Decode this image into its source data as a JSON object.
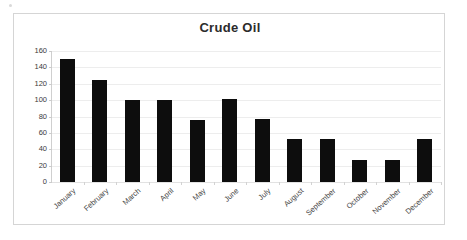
{
  "chart_data": {
    "type": "bar",
    "title": "Crude Oil",
    "xlabel": "",
    "ylabel": "",
    "ylim": [
      0,
      160
    ],
    "ytick_step": 20,
    "yticks": [
      160,
      140,
      120,
      100,
      80,
      60,
      40,
      20,
      0
    ],
    "grid": true,
    "legend": "none",
    "bar_color": "#0d0d0d",
    "gridline_color": "#ededed",
    "categories": [
      "January",
      "February",
      "March",
      "April",
      "May",
      "June",
      "July",
      "August",
      "September",
      "October",
      "November",
      "December"
    ],
    "values": [
      150,
      125,
      100,
      100,
      76,
      101,
      77,
      52,
      52,
      27,
      27,
      53
    ]
  }
}
